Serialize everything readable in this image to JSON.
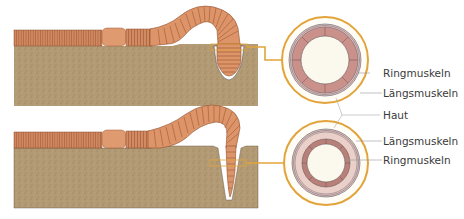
{
  "diagram": {
    "panels": [
      {
        "id": "top",
        "description": "Worm head segment contracted (short and thick) in burrow",
        "labels": [
          "Ringmuskeln",
          "Längsmuskeln"
        ]
      },
      {
        "id": "bottom",
        "description": "Worm head segment extended (long and thin) pushing into soil",
        "labels": [
          "Längsmuskeln",
          "Ringmuskeln"
        ]
      }
    ],
    "shared_label": "Haut"
  },
  "labels": {
    "top_ring": "Ringmuskeln",
    "top_laengs": "Längsmuskeln",
    "haut": "Haut",
    "bottom_laengs": "Längsmuskeln",
    "bottom_ring": "Ringmuskeln"
  },
  "colors": {
    "soil": "#b29a74",
    "soil_dark": "#9c8462",
    "worm": "#d9926a",
    "worm_dark": "#b56e4a",
    "connector": "#e2a43a",
    "muscle": "#c9918a",
    "muscle_light": "#e3bdb6",
    "lumen": "#fbf8ee"
  }
}
